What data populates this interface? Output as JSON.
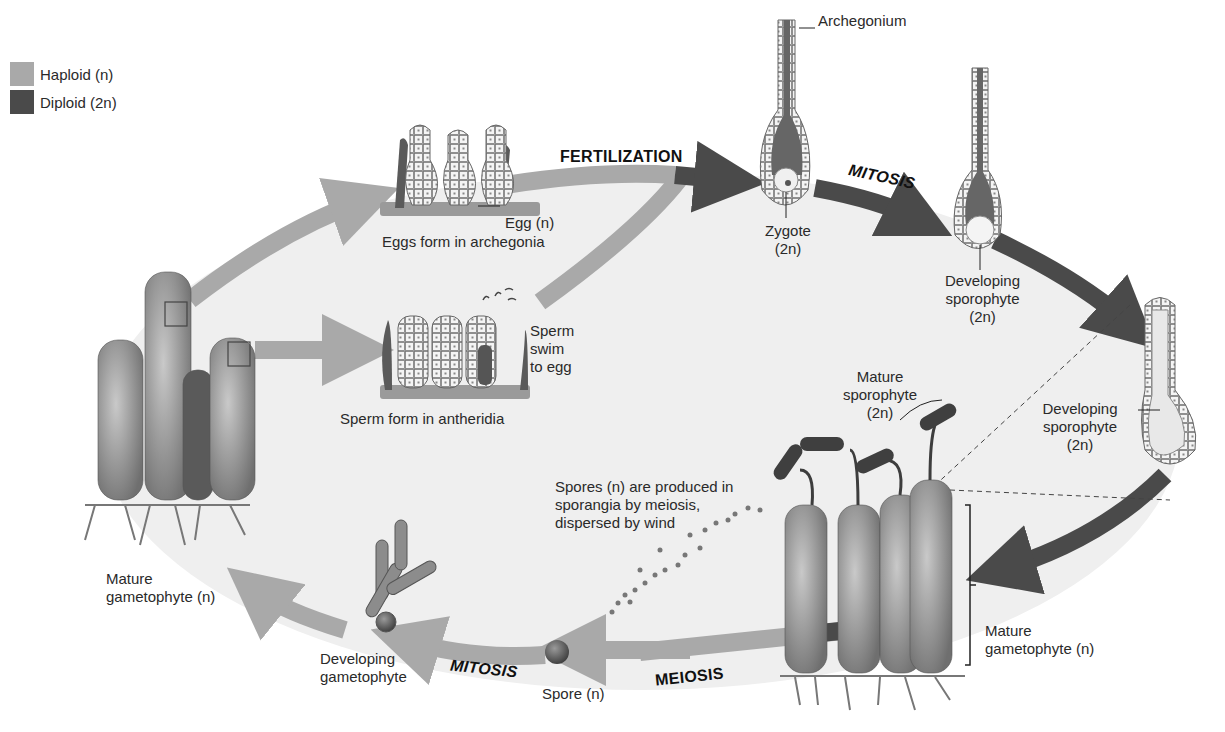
{
  "colors": {
    "haploid": "#a9a9a9",
    "diploid": "#4a4a4a",
    "background_oval": "#efefef"
  },
  "legend": {
    "items": [
      {
        "label": "Haploid (n)",
        "color": "#a9a9a9"
      },
      {
        "label": "Diploid (2n)",
        "color": "#4a4a4a"
      }
    ]
  },
  "stages": {
    "fertilization": "FERTILIZATION",
    "mitosis_top": "MITOSIS",
    "meiosis": "MEIOSIS",
    "mitosis_bottom": "MITOSIS"
  },
  "labels": {
    "archegonium": "Archegonium",
    "egg": "Egg (n)",
    "eggs_form": "Eggs form in archegonia",
    "sperm_swim": [
      "Sperm",
      "swim",
      "to egg"
    ],
    "sperm_form": "Sperm form in antheridia",
    "zygote": [
      "Zygote",
      "(2n)"
    ],
    "developing_sporophyte_1": [
      "Developing",
      "sporophyte",
      "(2n)"
    ],
    "developing_sporophyte_2": [
      "Developing",
      "sporophyte",
      "(2n)"
    ],
    "mature_sporophyte": [
      "Mature",
      "sporophyte",
      "(2n)"
    ],
    "spores": [
      "Spores (n) are produced in",
      "sporangia by meiosis,",
      "dispersed by wind"
    ],
    "mature_gametophyte_right": [
      "Mature",
      "gametophyte (n)"
    ],
    "spore": "Spore (n)",
    "developing_gametophyte": [
      "Developing",
      "gametophyte"
    ],
    "mature_gametophyte_left": [
      "Mature",
      "gametophyte (n)"
    ]
  }
}
